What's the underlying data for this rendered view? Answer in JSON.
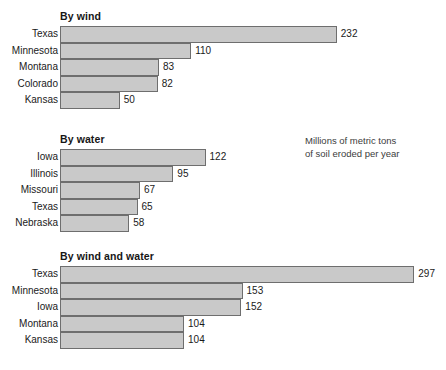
{
  "caption": {
    "line1": "Millions of metric tons",
    "line2": "of soil eroded per year"
  },
  "chart_data": {
    "type": "bar",
    "orientation": "horizontal",
    "title": "",
    "xlabel": "",
    "ylabel": "",
    "grid": false,
    "legend": "none",
    "unit_note": "Millions of metric tons of soil eroded per year",
    "xlim": [
      0,
      297
    ],
    "px_per_unit": 1.193,
    "panels": [
      {
        "title": "By wind",
        "categories": [
          "Texas",
          "Minnesota",
          "Montana",
          "Colorado",
          "Kansas"
        ],
        "values": [
          232,
          110,
          83,
          82,
          50
        ]
      },
      {
        "title": "By water",
        "categories": [
          "Iowa",
          "Illinois",
          "Missouri",
          "Texas",
          "Nebraska"
        ],
        "values": [
          122,
          95,
          67,
          65,
          58
        ]
      },
      {
        "title": "By wind and water",
        "categories": [
          "Texas",
          "Minnesota",
          "Iowa",
          "Montana",
          "Kansas"
        ],
        "values": [
          297,
          153,
          152,
          104,
          104
        ]
      }
    ]
  },
  "colors": {
    "bar_fill": "#c9c9c9",
    "bar_stroke": "#6e6e6e",
    "background": "#ffffff",
    "text": "#1a1a1a"
  }
}
